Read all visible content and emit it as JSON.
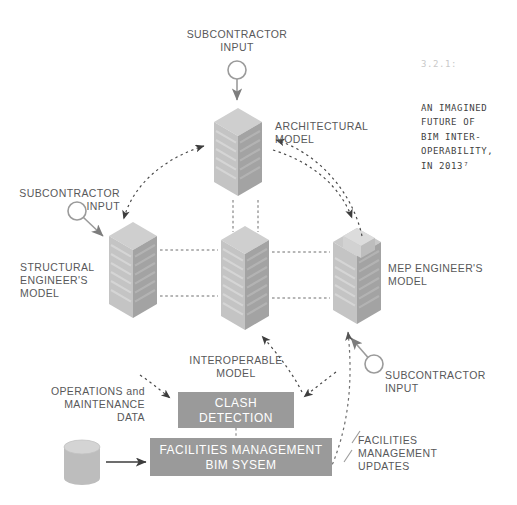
{
  "figure": {
    "caption_number": "3.2.1:",
    "caption_lines": [
      "AN IMAGINED",
      "FUTURE OF",
      "BIM INTER-",
      "OPERABILITY,",
      "IN 2013⁷"
    ],
    "caption_color": "#c9c9c9",
    "caption_body_color": "#3f3f3f"
  },
  "nodes": {
    "subcontractor_top": {
      "label": "SUBCONTRACTOR\nINPUT",
      "icon": "circle-node-icon"
    },
    "subcontractor_left": {
      "label": "SUBCONTRACTOR\nINPUT",
      "icon": "circle-node-icon"
    },
    "subcontractor_right": {
      "label": "SUBCONTRACTOR\nINPUT",
      "icon": "circle-node-icon"
    },
    "architectural_model": {
      "label": "ARCHITECTURAL\nMODEL",
      "icon": "building-tower-icon"
    },
    "structural_model": {
      "label": "STRUCTURAL\nENGINEER'S\nMODEL",
      "icon": "building-tower-icon"
    },
    "mep_model": {
      "label": "MEP ENGINEER'S\nMODEL",
      "icon": "building-tower-flat-roof-icon"
    },
    "interoperable_model": {
      "label": "INTEROPERABLE\nMODEL",
      "icon": "building-tower-icon"
    },
    "operations_data": {
      "label": "OPERATIONS and\nMAINTENANCE\nDATA",
      "icon": "database-cylinder-icon"
    },
    "facilities_updates": {
      "label": "FACILITIES\nMANAGEMENT\nUPDATES"
    }
  },
  "boxes": {
    "clash_detection": {
      "label": "CLASH\nDETECTION",
      "fill": "#9a9a9a",
      "text_color": "#ffffff"
    },
    "fm_bim_system": {
      "label": "FACILITIES MANAGEMENT\nBIM SYSEM",
      "fill": "#9a9a9a",
      "text_color": "#ffffff"
    }
  },
  "style": {
    "building_light": "#c9c9c9",
    "building_mid": "#b4b4b4",
    "building_dark": "#9d9d9d",
    "line_color": "#6e6e6e",
    "text_color": "#58585a",
    "background": "#ffffff"
  }
}
